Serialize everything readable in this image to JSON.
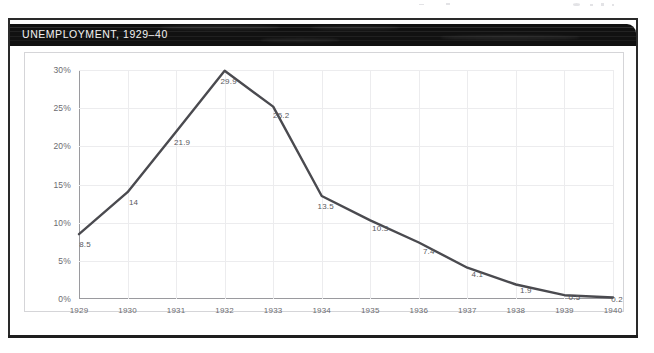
{
  "document": {
    "title_bar": {
      "text": "UNEMPLOYMENT, 1929–40"
    }
  },
  "chart_data": {
    "type": "line",
    "title": "UNEMPLOYMENT, 1929–40",
    "xlabel": "",
    "ylabel": "",
    "categories": [
      "1929",
      "1930",
      "1931",
      "1932",
      "1933",
      "1934",
      "1935",
      "1936",
      "1937",
      "1938",
      "1939",
      "1940"
    ],
    "values": [
      8.5,
      14,
      21.9,
      29.9,
      25.2,
      13.5,
      10.3,
      7.4,
      4.1,
      1.9,
      0.5,
      0.2
    ],
    "point_labels": [
      "8.5",
      "14",
      "21.9",
      "29.9",
      "25.2",
      "13.5",
      "10.3",
      "7.4",
      "4.1",
      "1.9",
      "0.5",
      "0.2"
    ],
    "series": [
      {
        "name": "Unemployment",
        "values": [
          8.5,
          14,
          21.9,
          29.9,
          25.2,
          13.5,
          10.3,
          7.4,
          4.1,
          1.9,
          0.5,
          0.2
        ]
      }
    ],
    "ylim": [
      0,
      30
    ],
    "yticks": [
      0,
      5,
      10,
      15,
      20,
      25,
      30
    ],
    "ytick_labels": [
      "0%",
      "5%",
      "10%",
      "15%",
      "20%",
      "25%",
      "30%"
    ],
    "grid": true,
    "legend": "none",
    "line_color": "#4a4a4f"
  },
  "colors": {
    "title_bar_background": "#111111",
    "title_bar_text": "#f2f2f2",
    "plot_line": "#4a4a4f",
    "gridline": "#ececee",
    "axis": "#9a9a9e",
    "tick_text": "#6b6b70",
    "page_frame": "#2a2a2a"
  }
}
